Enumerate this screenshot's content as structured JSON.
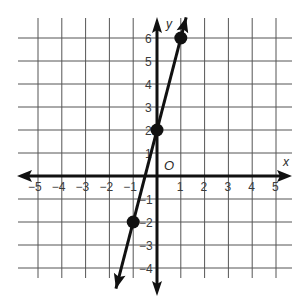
{
  "chart_data": {
    "type": "line",
    "title": "",
    "xlabel": "x",
    "ylabel": "y",
    "origin_label": "O",
    "xlim": [
      -5,
      5
    ],
    "ylim": [
      -4,
      6
    ],
    "grid": true,
    "x_ticks": [
      "-5",
      "-4",
      "-3",
      "-2",
      "-1",
      "1",
      "2",
      "3",
      "4",
      "5"
    ],
    "y_ticks": [
      "6",
      "5",
      "4",
      "3",
      "2",
      "1",
      "-1",
      "-2",
      "-3",
      "-4"
    ],
    "series": [
      {
        "name": "line",
        "equation": "y = 4x + 2",
        "points": [
          {
            "x": -1,
            "y": -2
          },
          {
            "x": 0,
            "y": 2
          },
          {
            "x": 1,
            "y": 6
          }
        ],
        "arrows_both_ends": true
      }
    ]
  }
}
